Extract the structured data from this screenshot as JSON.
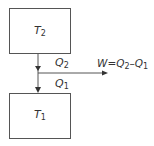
{
  "diagram": {
    "type": "heat engine schematic",
    "hot_reservoir": {
      "symbol": "T",
      "subscript": "2"
    },
    "cold_reservoir": {
      "symbol": "T",
      "subscript": "1"
    },
    "heat_in": {
      "symbol": "Q",
      "subscript": "2"
    },
    "heat_out": {
      "symbol": "Q",
      "subscript": "1"
    },
    "work": {
      "prefix": "W=Q",
      "sub_a": "2",
      "mid": "–Q",
      "sub_b": "1"
    },
    "colors": {
      "stroke": "#555555",
      "text": "#333333"
    }
  }
}
